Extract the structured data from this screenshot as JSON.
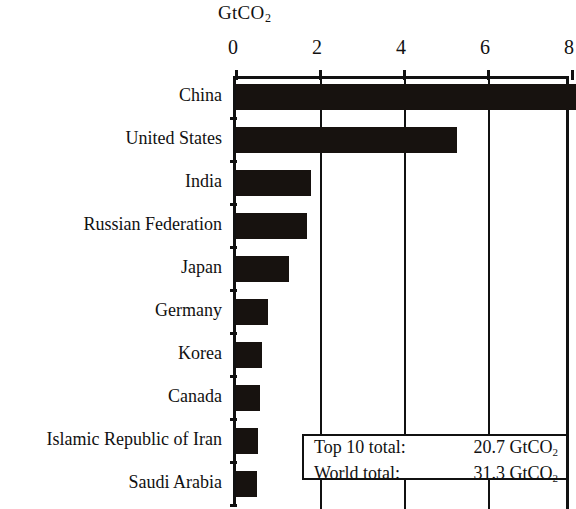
{
  "chart_data": {
    "type": "bar",
    "orientation": "horizontal",
    "title": "",
    "subtitle": "",
    "xlabel": "GtCO2",
    "ylabel": "",
    "unit_label": "GtCO",
    "unit_subscript": "2",
    "categories": [
      "China",
      "United States",
      "India",
      "Russian Federation",
      "Japan",
      "Germany",
      "Korea",
      "Canada",
      "Islamic Republic of Iran",
      "Saudi Arabia"
    ],
    "values": [
      8.2,
      5.25,
      1.78,
      1.7,
      1.27,
      0.75,
      0.63,
      0.57,
      0.52,
      0.49
    ],
    "xlim": [
      0,
      8
    ],
    "x_ticks": [
      0,
      2,
      4,
      6,
      8
    ],
    "x_tick_labels": [
      "0",
      "2",
      "4",
      "6",
      "8"
    ],
    "grid": "vertical",
    "legend": "none",
    "bar_color": "#17120f",
    "axis_color": "#111111",
    "background_color": "#ffffff"
  },
  "annotations": {
    "totals_box": {
      "rows": [
        {
          "label": "Top 10 total:",
          "value": "20.7 GtCO",
          "value_sub": "2"
        },
        {
          "label": "World  total:",
          "value": "31.3 GtCO",
          "value_sub": "2"
        }
      ]
    }
  }
}
